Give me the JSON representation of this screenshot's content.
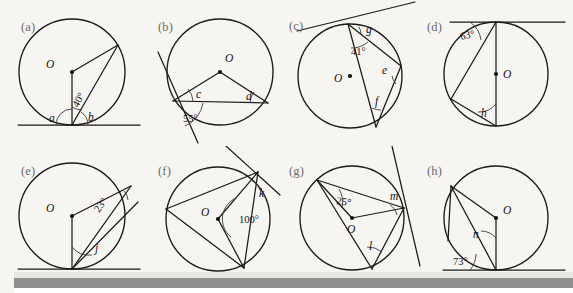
{
  "figure": {
    "kind": "circle-theorem-exercise-panels",
    "background_color": "#f7f5f2",
    "ink_color": "#1a1a1a",
    "panel_label_color": "#6d6a67",
    "panels": [
      {
        "id": "a",
        "label": "(a)",
        "center_label": "O",
        "given_angles": [
          "40°"
        ],
        "unknown_angles": [
          "a",
          "b"
        ],
        "features": [
          "circle",
          "horizontal tangent at bottom",
          "radius to point of contact",
          "chord to circle point",
          "tangent-chord angles"
        ]
      },
      {
        "id": "b",
        "label": "(b)",
        "center_label": "O",
        "given_angles": [
          "55°"
        ],
        "unknown_angles": [
          "c",
          "d"
        ],
        "features": [
          "circle",
          "tangent at lower-left",
          "chord across circle",
          "two radii forming triangle"
        ]
      },
      {
        "id": "c",
        "label": "(c)",
        "center_label": "O",
        "given_angles": [
          "41°"
        ],
        "unknown_angles": [
          "e",
          "f",
          "g"
        ],
        "features": [
          "circle",
          "tangent at top point",
          "diameter-like chord",
          "inscribed triangle"
        ]
      },
      {
        "id": "d",
        "label": "(d)",
        "center_label": "O",
        "given_angles": [
          "63°"
        ],
        "unknown_angles": [
          "h"
        ],
        "features": [
          "circle",
          "horizontal tangent at top",
          "vertical diameter",
          "inscribed triangle"
        ]
      },
      {
        "id": "e",
        "label": "(e)",
        "center_label": "O",
        "given_angles": [
          "23°"
        ],
        "unknown_angles": [
          "j"
        ],
        "features": [
          "circle",
          "horizontal tangent at bottom",
          "vertical radius",
          "chord to upper-right point"
        ]
      },
      {
        "id": "f",
        "label": "(f)",
        "center_label": "O",
        "given_angles": [
          "100°"
        ],
        "unknown_angles": [
          "k"
        ],
        "features": [
          "circle",
          "tangent at upper-right point",
          "two radii with reflex-style central angle",
          "chords"
        ]
      },
      {
        "id": "g",
        "label": "(g)",
        "center_label": "O",
        "given_angles": [
          "25°"
        ],
        "unknown_angles": [
          "l",
          "m"
        ],
        "features": [
          "circle",
          "tangent at right point",
          "two radii",
          "chords to bottom point"
        ]
      },
      {
        "id": "h",
        "label": "(h)",
        "center_label": "O",
        "given_angles": [
          "73°"
        ],
        "unknown_angles": [
          "n"
        ],
        "features": [
          "circle",
          "horizontal tangent at bottom",
          "vertical radius",
          "chord to upper-left point"
        ]
      }
    ]
  }
}
